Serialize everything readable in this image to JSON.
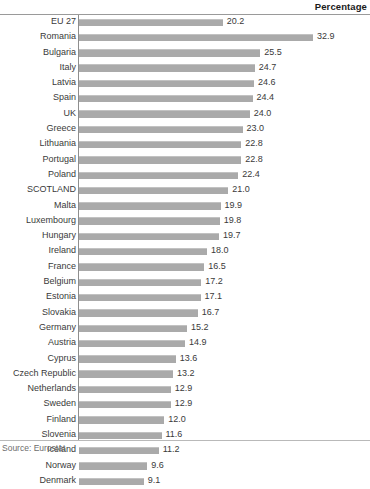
{
  "header": {
    "title": "Percentage"
  },
  "source": {
    "note": "Source: Eurostat"
  },
  "chart_data": {
    "type": "bar",
    "orientation": "horizontal",
    "title": "",
    "subtitle": "",
    "xlabel": "Percentage",
    "ylabel": "",
    "xlim": [
      0,
      36
    ],
    "grid": false,
    "legend": null,
    "highlight_category": "SCOTLAND",
    "bar_color": "#aaaaaa",
    "categories": [
      "EU 27",
      "Romania",
      "Bulgaria",
      "Italy",
      "Latvia",
      "Spain",
      "UK",
      "Greece",
      "Lithuania",
      "Portugal",
      "Poland",
      "SCOTLAND",
      "Malta",
      "Luxembourg",
      "Hungary",
      "Ireland",
      "France",
      "Belgium",
      "Estonia",
      "Slovakia",
      "Germany",
      "Austria",
      "Cyprus",
      "Czech Republic",
      "Netherlands",
      "Sweden",
      "Finland",
      "Slovenia",
      "Iceland",
      "Norway",
      "Denmark"
    ],
    "values": [
      20.2,
      32.9,
      25.5,
      24.7,
      24.6,
      24.4,
      24.0,
      23.0,
      22.8,
      22.8,
      22.4,
      21.0,
      19.9,
      19.8,
      19.7,
      18.0,
      16.5,
      17.2,
      17.1,
      16.7,
      15.2,
      14.9,
      13.6,
      13.2,
      12.9,
      12.9,
      12.0,
      11.6,
      11.2,
      9.6,
      9.1
    ],
    "value_labels": [
      "20.2",
      "32.9",
      "25.5",
      "24.7",
      "24.6",
      "24.4",
      "24.0",
      "23.0",
      "22.8",
      "22.8",
      "22.4",
      "21.0",
      "19.9",
      "19.8",
      "19.7",
      "18.0",
      "16.5",
      "17.2",
      "17.1",
      "16.7",
      "15.2",
      "14.9",
      "13.6",
      "13.2",
      "12.9",
      "12.9",
      "12.0",
      "11.6",
      "11.2",
      "9.6",
      "9.1"
    ],
    "bar_lengths": [
      20.2,
      32.9,
      25.5,
      24.7,
      24.6,
      24.4,
      24.0,
      23.0,
      22.8,
      22.8,
      22.4,
      21.0,
      19.9,
      19.8,
      19.7,
      18.0,
      17.6,
      17.2,
      17.1,
      16.7,
      15.2,
      14.9,
      13.6,
      13.2,
      12.9,
      12.9,
      12.0,
      11.6,
      11.2,
      9.6,
      9.1
    ]
  }
}
